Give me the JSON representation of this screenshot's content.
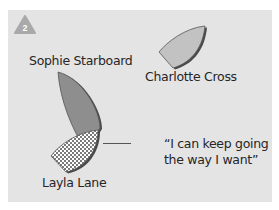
{
  "diagram": {
    "step_badge": "2",
    "colors": {
      "card_background": "#e4e4e4",
      "badge": "#a9a9a9",
      "boat_dark": "#8e8e8e",
      "boat_light": "#c2c2c2",
      "boat_shadow": "#4a4a4a",
      "text": "#262626"
    },
    "boats": [
      {
        "name": "Sophie Starboard",
        "fill": "solid-dark"
      },
      {
        "name": "Charlotte Cross",
        "fill": "solid-light"
      },
      {
        "name": "Layla Lane",
        "fill": "checkered"
      }
    ],
    "quote": {
      "speaker": "Layla Lane",
      "line1": "“I can keep going",
      "line2": "the way I want”"
    }
  }
}
